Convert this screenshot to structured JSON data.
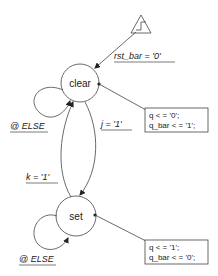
{
  "diagram": {
    "type": "state-machine",
    "reset": {
      "icon": "reset-step-triangle-icon",
      "condition": "rst_bar = '0'"
    },
    "states": [
      {
        "id": "clear",
        "label": "clear",
        "self_loop": "@ ELSE",
        "actions": [
          "q < = '0';",
          "q_bar < = '1';"
        ]
      },
      {
        "id": "set",
        "label": "set",
        "self_loop": "@ ELSE",
        "actions": [
          "q < = '1';",
          "q_bar < = '0';"
        ]
      }
    ],
    "transitions": [
      {
        "from": "clear",
        "to": "set",
        "condition": "j = '1'"
      },
      {
        "from": "set",
        "to": "clear",
        "condition": "k = '1'"
      }
    ]
  }
}
